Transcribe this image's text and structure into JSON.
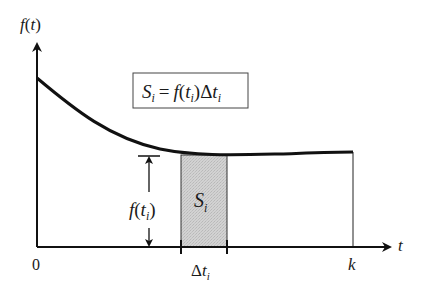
{
  "diagram": {
    "type": "riemann-sum-strip",
    "y_axis_label": {
      "func": "f",
      "open": "(",
      "var": "t",
      "close": ")"
    },
    "x_axis_label": "t",
    "origin_label": "0",
    "end_label": "k",
    "formula": {
      "lhs": "S",
      "lhs_sub": "i",
      "eq": "=",
      "func": "f",
      "open": "(",
      "var": "t",
      "var_sub": "i",
      "close": ")",
      "delta": "Δ",
      "dvar": "t",
      "dvar_sub": "i"
    },
    "strip_label": {
      "main": "S",
      "sub": "i"
    },
    "height_label": {
      "func": "f",
      "open": "(",
      "var": "t",
      "sub": "i",
      "close": ")"
    },
    "width_label": {
      "delta": "Δ",
      "var": "t",
      "sub": "i"
    },
    "colors": {
      "line": "#111111",
      "strip_fill": "#cfcfcf",
      "box_border": "#444444"
    }
  }
}
